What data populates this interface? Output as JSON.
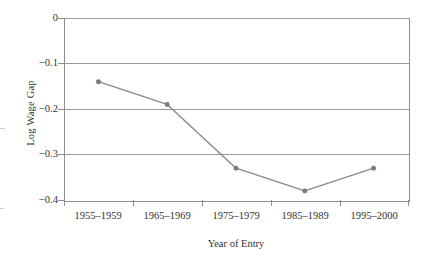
{
  "chart_data": {
    "type": "line",
    "title": "",
    "xlabel": "Year of Entry",
    "ylabel": "Log Wage Gap",
    "categories": [
      "1955–1959",
      "1965–1969",
      "1975–1979",
      "1985–1989",
      "1995–2000"
    ],
    "values": [
      -0.14,
      -0.19,
      -0.33,
      -0.38,
      -0.33
    ],
    "series": [
      {
        "name": "Log Wage Gap",
        "values": [
          -0.14,
          -0.19,
          -0.33,
          -0.38,
          -0.33
        ]
      }
    ],
    "ylim": [
      -0.4,
      0
    ],
    "ytick_labels": [
      "0",
      "−0.1",
      "−0.2",
      "−0.3",
      "−0.4"
    ],
    "ytick_values": [
      0,
      -0.1,
      -0.2,
      -0.3,
      -0.4
    ],
    "grid": true,
    "legend": "none",
    "line_color": "#8a8a8a",
    "marker_color": "#7a7a7a",
    "axis_color": "#8d8d8d",
    "background": "#ffffff"
  },
  "axes": {
    "y_title": "Log Wage Gap",
    "x_title": "Year of Entry"
  },
  "ticks": {
    "y": [
      {
        "label": "0",
        "value": 0
      },
      {
        "label": "−0.1",
        "value": -0.1
      },
      {
        "label": "−0.2",
        "value": -0.2
      },
      {
        "label": "−0.3",
        "value": -0.3
      },
      {
        "label": "−0.4",
        "value": -0.4
      }
    ],
    "x": [
      {
        "label": "1955–1959"
      },
      {
        "label": "1965–1969"
      },
      {
        "label": "1975–1979"
      },
      {
        "label": "1985–1989"
      },
      {
        "label": "1995–2000"
      }
    ]
  }
}
